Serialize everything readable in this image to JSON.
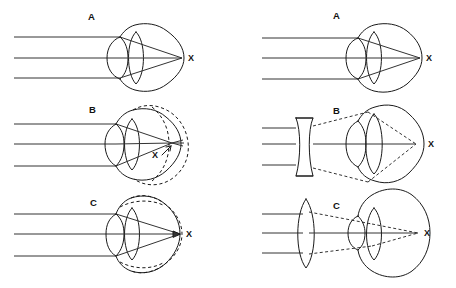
{
  "figure": {
    "background_color": "#ffffff",
    "stroke_color": "#1a1a1a",
    "ray_color": "#333333",
    "width": 456,
    "height": 288
  },
  "columns": [
    {
      "name": "uncorrected",
      "panels": [
        {
          "id": "left-a",
          "label": "A",
          "condition": "emmetropia-normal-eye",
          "focal_point_label": "X",
          "focal_point_note": "focus on retina at back of eye",
          "eye_outline": "solid",
          "has_dashed_outline": false,
          "corrective_lens": "none",
          "ray_count": 3,
          "ray_style": "solid"
        },
        {
          "id": "left-b",
          "label": "B",
          "condition": "myopia-elongated-eye",
          "focal_point_label": "X",
          "focal_point_note": "focus in front of retina inside elongated eye",
          "eye_outline": "solid",
          "has_dashed_outline": true,
          "dashed_outline_note": "elongated eyeball shown dashed",
          "corrective_lens": "none",
          "ray_count": 3,
          "ray_style": "solid"
        },
        {
          "id": "left-c",
          "label": "C",
          "condition": "hyperopia-shortened-eye",
          "focal_point_label": "X",
          "focal_point_note": "focus behind retina of shortened eye",
          "eye_outline": "solid",
          "has_dashed_outline": true,
          "dashed_outline_note": "normal eyeball shown dashed",
          "corrective_lens": "none",
          "ray_count": 3,
          "ray_style": "solid"
        }
      ]
    },
    {
      "name": "corrected",
      "panels": [
        {
          "id": "right-a",
          "label": "A",
          "condition": "emmetropia-normal-eye",
          "focal_point_label": "X",
          "focal_point_note": "focus on retina at back of eye",
          "eye_outline": "solid",
          "has_dashed_outline": false,
          "corrective_lens": "none",
          "ray_count": 3,
          "ray_style": "solid"
        },
        {
          "id": "right-b",
          "label": "B",
          "condition": "myopia-corrected",
          "focal_point_label": "X",
          "focal_point_note": "focus moved back onto retina",
          "eye_outline": "solid",
          "has_dashed_outline": false,
          "corrective_lens": "concave-biconcave-diverging",
          "ray_count": 3,
          "ray_style": "dashed-after-lens"
        },
        {
          "id": "right-c",
          "label": "C",
          "condition": "hyperopia-corrected",
          "focal_point_label": "X",
          "focal_point_note": "focus moved forward onto retina",
          "eye_outline": "solid",
          "has_dashed_outline": false,
          "corrective_lens": "convex-biconvex-converging",
          "ray_count": 3,
          "ray_style": "dashed-after-lens"
        }
      ]
    }
  ],
  "labels": {
    "panel_a": "A",
    "panel_b": "B",
    "panel_c": "C",
    "focal_point": "X"
  }
}
